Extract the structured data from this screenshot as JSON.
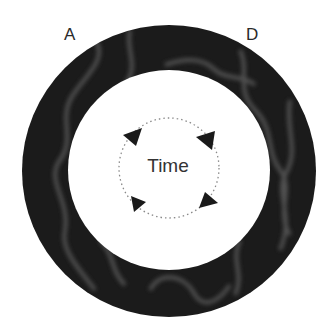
{
  "labels": {
    "top_left": "A",
    "top_right": "D"
  },
  "center": {
    "text": "Time"
  },
  "ring": {
    "color": "#1c1c1c",
    "highlight": "#5a5a5a"
  },
  "cycle": {
    "arrows": 4,
    "direction": "clockwise",
    "style": "dotted-circle"
  }
}
